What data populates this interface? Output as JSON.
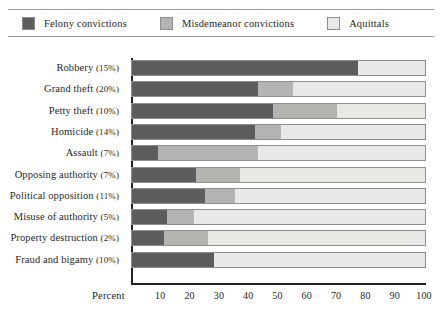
{
  "legend": {
    "items": [
      {
        "label": "Felony convictions",
        "color": "#5d5d5d",
        "key": "felony"
      },
      {
        "label": "Misdemeanor convictions",
        "color": "#b4b4b2",
        "key": "misdemeanor"
      },
      {
        "label": "Aquittals",
        "color": "#e8e8e6",
        "key": "acquittals"
      }
    ]
  },
  "axis": {
    "x_title": "Percent",
    "x_ticks": [
      "10",
      "20",
      "30",
      "40",
      "50",
      "60",
      "70",
      "80",
      "90",
      "100"
    ],
    "x_tick_values": [
      10,
      20,
      30,
      40,
      50,
      60,
      70,
      80,
      90,
      100
    ]
  },
  "chart_data": {
    "type": "bar",
    "orientation": "horizontal",
    "stacked": true,
    "stack_mode": "percent",
    "title": "",
    "subtitle": "",
    "xlabel": "Percent",
    "ylabel": "",
    "xlim": [
      0,
      100
    ],
    "grid": false,
    "legend_position": "top",
    "categories": [
      "Robbery (15%)",
      "Grand theft (20%)",
      "Petty theft (10%)",
      "Homicide (14%)",
      "Assault (7%)",
      "Opposing authority (7%)",
      "Political opposition (11%)",
      "Misuse of authority (5%)",
      "Property destruction (2%)",
      "Fraud and bigamy (10%)"
    ],
    "category_names": [
      "Robbery",
      "Grand theft",
      "Petty theft",
      "Homicide",
      "Assault",
      "Opposing authority",
      "Political opposition",
      "Misuse of authority",
      "Property destruction",
      "Fraud and bigamy"
    ],
    "category_shares": [
      15,
      20,
      10,
      14,
      7,
      7,
      11,
      5,
      2,
      10
    ],
    "series": [
      {
        "name": "Felony convictions",
        "color": "#5d5d5d",
        "values": [
          77,
          43,
          48,
          42,
          9,
          22,
          25,
          12,
          11,
          28
        ]
      },
      {
        "name": "Misdemeanor convictions",
        "color": "#b4b4b2",
        "values": [
          0,
          12,
          22,
          9,
          34,
          15,
          10,
          9,
          15,
          0
        ]
      },
      {
        "name": "Aquittals",
        "color": "#e8e8e6",
        "values": [
          23,
          45,
          30,
          49,
          57,
          63,
          65,
          79,
          74,
          72
        ]
      }
    ]
  }
}
